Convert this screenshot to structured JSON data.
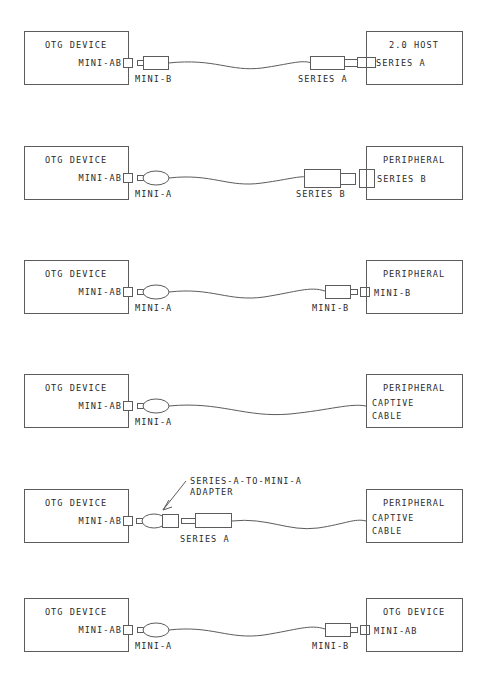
{
  "diagram": {
    "stroke_color": "#5c5c5c",
    "text_color": "#2b2b2b",
    "background_color": "#ffffff",
    "rows": [
      {
        "id": "row-1",
        "left_box": {
          "title": "OTG DEVICE",
          "port_label": "MINI-AB",
          "port_type": "mini-ab-receptacle"
        },
        "right_box": {
          "title": "2.0 HOST",
          "port_label": "SERIES A",
          "port_type": "series-a-receptacle"
        },
        "left_connector": {
          "label": "MINI-B",
          "shape": "mini-b-plug"
        },
        "right_connector": {
          "label": "SERIES A",
          "shape": "series-a-plug"
        },
        "cable": "standard"
      },
      {
        "id": "row-2",
        "left_box": {
          "title": "OTG DEVICE",
          "port_label": "MINI-AB",
          "port_type": "mini-ab-receptacle"
        },
        "right_box": {
          "title": "PERIPHERAL",
          "port_label": "SERIES B",
          "port_type": "series-b-receptacle"
        },
        "left_connector": {
          "label": "MINI-A",
          "shape": "mini-a-plug"
        },
        "right_connector": {
          "label": "SERIES B",
          "shape": "series-b-plug"
        },
        "cable": "standard"
      },
      {
        "id": "row-3",
        "left_box": {
          "title": "OTG DEVICE",
          "port_label": "MINI-AB",
          "port_type": "mini-ab-receptacle"
        },
        "right_box": {
          "title": "PERIPHERAL",
          "port_label": "MINI-B",
          "port_type": "mini-b-receptacle"
        },
        "left_connector": {
          "label": "MINI-A",
          "shape": "mini-a-plug"
        },
        "right_connector": {
          "label": "MINI-B",
          "shape": "mini-b-plug"
        },
        "cable": "standard"
      },
      {
        "id": "row-4",
        "left_box": {
          "title": "OTG DEVICE",
          "port_label": "MINI-AB",
          "port_type": "mini-ab-receptacle"
        },
        "right_box": {
          "title": "PERIPHERAL",
          "port_label": "CAPTIVE CABLE",
          "port_label_line1": "CAPTIVE",
          "port_label_line2": "CABLE",
          "port_type": "captive-cable"
        },
        "left_connector": {
          "label": "MINI-A",
          "shape": "mini-a-plug"
        },
        "right_connector": {
          "label": "",
          "shape": "none"
        },
        "cable": "captive"
      },
      {
        "id": "row-5",
        "left_box": {
          "title": "OTG DEVICE",
          "port_label": "MINI-AB",
          "port_type": "mini-ab-receptacle"
        },
        "right_box": {
          "title": "PERIPHERAL",
          "port_label": "CAPTIVE CABLE",
          "port_label_line1": "CAPTIVE",
          "port_label_line2": "CABLE",
          "port_type": "captive-cable"
        },
        "left_connector": {
          "label": "",
          "shape": "mini-a-plug-adapter"
        },
        "right_connector": {
          "label": "SERIES A",
          "shape": "series-a-plug"
        },
        "cable": "captive",
        "callout": {
          "line1": "SERIES-A-TO-MINI-A",
          "line2": "ADAPTER",
          "arrow": "down-left-arrow"
        }
      },
      {
        "id": "row-6",
        "left_box": {
          "title": "OTG DEVICE",
          "port_label": "MINI-AB",
          "port_type": "mini-ab-receptacle"
        },
        "right_box": {
          "title": "OTG DEVICE",
          "port_label": "MINI-AB",
          "port_type": "mini-ab-receptacle"
        },
        "left_connector": {
          "label": "MINI-A",
          "shape": "mini-a-plug"
        },
        "right_connector": {
          "label": "MINI-B",
          "shape": "mini-b-plug"
        },
        "cable": "standard"
      }
    ]
  }
}
